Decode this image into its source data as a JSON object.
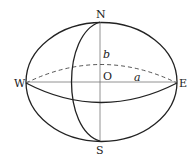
{
  "diagram": {
    "type": "ellipsoid-of-revolution",
    "labels": {
      "north": "N",
      "south": "S",
      "west": "W",
      "east": "E",
      "origin": "O",
      "semi_major": "a",
      "semi_minor": "b"
    },
    "colors": {
      "stroke": "#222222",
      "axis": "#777777",
      "background": "#ffffff"
    }
  }
}
